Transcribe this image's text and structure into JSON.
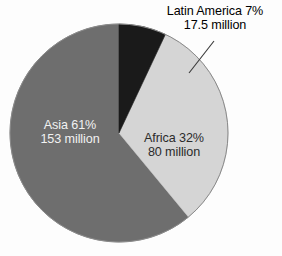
{
  "chart_data": {
    "type": "pie",
    "title": "",
    "subtitle": "",
    "xlabel": "",
    "ylabel": "",
    "legend_position": "none",
    "grid": false,
    "units": "million",
    "categories": [
      "Latin America",
      "Africa",
      "Asia"
    ],
    "values": [
      7,
      32,
      61
    ],
    "absolute_values": [
      17.5,
      80,
      153
    ],
    "slices": [
      {
        "name": "Latin America",
        "percent": 7,
        "percent_text": "7%",
        "value": 17.5,
        "value_text": "17.5 million",
        "label_line_1": "Latin America 7%",
        "label_line_2": "17.5 million",
        "color": "#1a1a1a",
        "text_color": "#000000",
        "label_placement": "outside-callout",
        "start_angle_deg": 0,
        "end_angle_deg": 25.2
      },
      {
        "name": "Africa",
        "percent": 32,
        "percent_text": "32%",
        "value": 80,
        "value_text": "80 million",
        "label_line_1": "Africa 32%",
        "label_line_2": "80 million",
        "color": "#d5d5d5",
        "text_color": "#2b2b2b",
        "label_placement": "inside",
        "start_angle_deg": 25.2,
        "end_angle_deg": 140.4
      },
      {
        "name": "Asia",
        "percent": 61,
        "percent_text": "61%",
        "value": 153,
        "value_text": "153 million",
        "label_line_1": "Asia 61%",
        "label_line_2": "153 million",
        "color": "#6e6e6e",
        "text_color": "#f2f2f2",
        "label_placement": "inside",
        "start_angle_deg": 140.4,
        "end_angle_deg": 360
      }
    ],
    "background_color": "#fdfdfd",
    "outline_color": "#8a8a8a"
  },
  "labels": {
    "latin_america": {
      "line1": "Latin America 7%",
      "line2": "17.5 million"
    },
    "africa": {
      "line1": "Africa 32%",
      "line2": "80 million"
    },
    "asia": {
      "line1": "Asia 61%",
      "line2": "153 million"
    }
  }
}
